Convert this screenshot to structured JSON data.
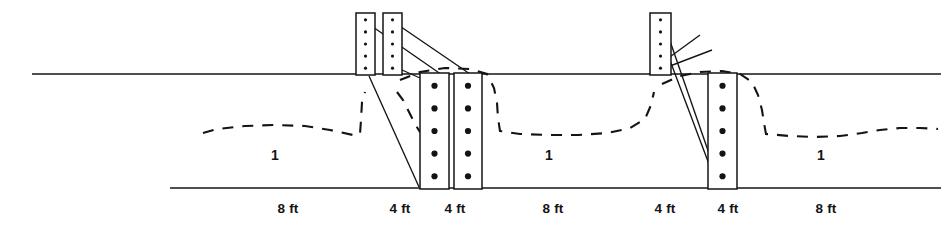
{
  "figure": {
    "type": "engineering-section-drawing",
    "width": 951,
    "height": 230,
    "background_color": "#ffffff",
    "ink_color": "#141414"
  },
  "lines": {
    "ground_line": {
      "label": "ground-surface-line",
      "x1": 32,
      "x2": 941,
      "y": 74,
      "style": "solid"
    },
    "base_line": {
      "label": "trench-bottom-line",
      "x1": 170,
      "x2": 941,
      "y": 188,
      "style": "solid"
    }
  },
  "dimension_labels": [
    {
      "text": "8 ft",
      "x": 288,
      "y": 201
    },
    {
      "text": "4 ft",
      "x": 400,
      "y": 201
    },
    {
      "text": "4 ft",
      "x": 455,
      "y": 201
    },
    {
      "text": "8 ft",
      "x": 553,
      "y": 201
    },
    {
      "text": "4 ft",
      "x": 665,
      "y": 201
    },
    {
      "text": "4 ft",
      "x": 728,
      "y": 201
    },
    {
      "text": "8 ft",
      "x": 826,
      "y": 201
    }
  ],
  "span_labels": [
    {
      "text": "1",
      "x": 275,
      "y": 147
    },
    {
      "text": "1",
      "x": 549,
      "y": 147
    },
    {
      "text": "1",
      "x": 821,
      "y": 147
    }
  ],
  "upper_posts": [
    {
      "name": "upper-post-left-a",
      "x": 356,
      "y": 13,
      "w": 19,
      "h": 62,
      "dots": 5,
      "dot_r": 1.6
    },
    {
      "name": "upper-post-left-b",
      "x": 383,
      "y": 13,
      "w": 19,
      "h": 62,
      "dots": 5,
      "dot_r": 1.6
    },
    {
      "name": "upper-post-right-a",
      "x": 650,
      "y": 13,
      "w": 21,
      "h": 62,
      "dots": 5,
      "dot_r": 1.6
    }
  ],
  "lower_posts": [
    {
      "name": "lower-post-left-a",
      "x": 420,
      "y": 73,
      "w": 29,
      "h": 116,
      "dots": 5,
      "dot_r": 3.1
    },
    {
      "name": "lower-post-left-b",
      "x": 454,
      "y": 73,
      "w": 28,
      "h": 116,
      "dots": 5,
      "dot_r": 3.1
    },
    {
      "name": "lower-post-right-a",
      "x": 708,
      "y": 73,
      "w": 29,
      "h": 116,
      "dots": 5,
      "dot_r": 3.1
    }
  ],
  "brace_lines": [
    {
      "name": "brace-left-1",
      "x1": 360,
      "y1": 18,
      "x2": 445,
      "y2": 77
    },
    {
      "name": "brace-left-2",
      "x1": 388,
      "y1": 18,
      "x2": 470,
      "y2": 74
    },
    {
      "name": "brace-left-3",
      "x1": 369,
      "y1": 76,
      "x2": 419,
      "y2": 187
    },
    {
      "name": "brace-left-4",
      "x1": 393,
      "y1": 66,
      "x2": 420,
      "y2": 78
    },
    {
      "name": "brace-right-1",
      "x1": 654,
      "y1": 18,
      "x2": 718,
      "y2": 188
    },
    {
      "name": "brace-right-2",
      "x1": 662,
      "y1": 18,
      "x2": 721,
      "y2": 188
    },
    {
      "name": "brace-right-3",
      "x1": 649,
      "y1": 74,
      "x2": 712,
      "y2": 50
    },
    {
      "name": "brace-right-4",
      "x1": 652,
      "y1": 70,
      "x2": 700,
      "y2": 35
    }
  ],
  "soil_curves": [
    {
      "name": "soil-curve-1",
      "path": "M 203 133 L 217 129 L 245 126 L 275 125 L 305 126 L 330 130 L 353 135 L 360 134 L 361 120 L 362 102 L 365 92"
    },
    {
      "name": "soil-curve-2",
      "path": "M 397 92 L 403 100 L 409 112 L 415 124 L 420 132 L 436 133"
    },
    {
      "name": "soil-curve-3",
      "path": "M 400 80 L 420 72 L 445 68 L 470 69 L 487 74 L 494 88 L 497 103 L 498 118 L 500 131 L 520 134 L 548 135 L 578 135 L 608 133 L 630 128 L 645 119 L 651 105 L 654 92"
    },
    {
      "name": "soil-curve-4",
      "path": "M 662 84 L 680 76 L 700 72 L 722 71 L 740 74 L 752 82 L 758 95 L 762 110 L 764 123 L 766 134 L 790 136 L 815 137 L 840 136 L 862 133 L 880 130 L 900 128 L 920 128 L 938 129"
    }
  ]
}
